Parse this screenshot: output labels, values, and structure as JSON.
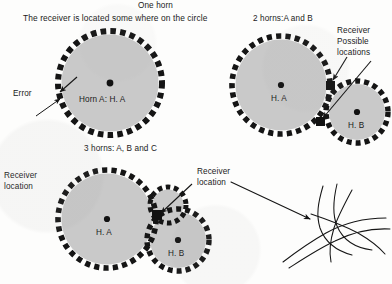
{
  "figure": {
    "ink_color": "#151515",
    "circle_fill": "#c9c9c9",
    "background": "#fdfdfc"
  },
  "panels": {
    "one_horn": {
      "title": "One horn",
      "subtitle": "The receiver is located some where on the circle",
      "error_label": "Error",
      "horn_label": "Horn  A: H. A",
      "circle": {
        "cx": 110,
        "cy": 83,
        "r": 52,
        "dashes": 34
      },
      "center_dot": {
        "cx": 110,
        "cy": 83,
        "r": 3.2
      },
      "error_arrows": [
        {
          "x1": 36,
          "y1": 116,
          "x2": 61,
          "y2": 99
        },
        {
          "x1": 75,
          "y1": 79,
          "x2": 59,
          "y2": 93
        }
      ]
    },
    "two_horns": {
      "title": "2 horns:A and B",
      "annotation": "Receiver\nPossible\nlocations",
      "horn_a_label": "H. A",
      "horn_b_label": "H. B",
      "circle_a": {
        "cx": 281,
        "cy": 85,
        "r": 49,
        "dashes": 32
      },
      "circle_b": {
        "cx": 357,
        "cy": 112,
        "r": 31,
        "dashes": 24
      },
      "center_dot_a": {
        "cx": 281,
        "cy": 85,
        "r": 3.0
      },
      "center_dot_b": {
        "cx": 357,
        "cy": 112,
        "r": 3.0
      },
      "intersection_markers": [
        {
          "cx": 330,
          "cy": 86,
          "size": 8
        },
        {
          "cx": 320,
          "cy": 121,
          "size": 8
        }
      ],
      "arrows": [
        {
          "x1": 345,
          "y1": 58,
          "x2": 331,
          "y2": 81
        },
        {
          "x1": 369,
          "y1": 62,
          "x2": 322,
          "y2": 118
        }
      ]
    },
    "three_horns": {
      "title": "3 horns: A, B and C",
      "annotation": "Receiver\nlocation",
      "horn_a_label": "H. A",
      "horn_b_label": "H. B",
      "circle_a": {
        "cx": 107,
        "cy": 219,
        "r": 49,
        "dashes": 32
      },
      "circle_b": {
        "cx": 178,
        "cy": 240,
        "r": 31,
        "dashes": 24
      },
      "circle_c": {
        "cx": 168,
        "cy": 205,
        "r": 18,
        "dashes": 16
      },
      "center_dot_a": {
        "cx": 107,
        "cy": 219,
        "r": 3.0
      },
      "center_dot_b": {
        "cx": 178,
        "cy": 240,
        "r": 3.0
      },
      "intersection_marker": {
        "cx": 157,
        "cy": 215,
        "size": 9
      },
      "arrow": {
        "x1": 190,
        "y1": 186,
        "x2": 160,
        "y2": 213
      }
    },
    "detail": {
      "annotation": "Receiver\nlocation",
      "arrow": {
        "x1": 233,
        "y1": 183,
        "x2": 311,
        "y2": 219
      },
      "target": {
        "cx": 312,
        "cy": 220
      }
    }
  },
  "text_positions": {
    "one_horn_title": {
      "x": 82,
      "y": 2
    },
    "one_horn_subtitle": {
      "x": 10,
      "y": 14
    },
    "error": {
      "x": 12,
      "y": 90
    },
    "horn_a_label_1": {
      "x": 80,
      "y": 96
    },
    "two_horns_title": {
      "x": 255,
      "y": 16
    },
    "two_horns_annotation": {
      "x": 336,
      "y": 28
    },
    "h_a_2": {
      "x": 270,
      "y": 95
    },
    "h_b_2": {
      "x": 347,
      "y": 122
    },
    "three_horns_title": {
      "x": 85,
      "y": 145
    },
    "three_horns_annotation": {
      "x": 196,
      "y": 169
    },
    "h_a_3": {
      "x": 96,
      "y": 229
    },
    "h_b_3": {
      "x": 168,
      "y": 250
    },
    "detail_annotation": {
      "x": 3,
      "y": 172
    }
  }
}
